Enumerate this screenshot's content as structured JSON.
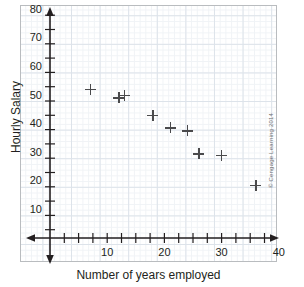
{
  "chart_data": {
    "type": "scatter",
    "title": "",
    "xlabel": "Number of years employed",
    "ylabel": "Hourly Salary",
    "xlim": [
      0,
      45
    ],
    "ylim": [
      0,
      85
    ],
    "grid": true,
    "legend": null,
    "x_ticks": [
      10,
      20,
      30,
      40
    ],
    "y_ticks": [
      10,
      20,
      30,
      40,
      50,
      60,
      70,
      80
    ],
    "x_minor_tick_step": 2.5,
    "y_minor_tick_step": 5,
    "marker": "plus",
    "marker_color": "#4a4a4c",
    "points": [
      {
        "x": 7,
        "y": 52
      },
      {
        "x": 12,
        "y": 49
      },
      {
        "x": 13,
        "y": 50
      },
      {
        "x": 18,
        "y": 43
      },
      {
        "x": 21,
        "y": 38.5
      },
      {
        "x": 24,
        "y": 37.5
      },
      {
        "x": 26,
        "y": 29.5
      },
      {
        "x": 30,
        "y": 29
      },
      {
        "x": 36,
        "y": 18.5
      }
    ]
  },
  "credit": "© Cengage Learning 2014",
  "colors": {
    "axis": "#231f20",
    "marker": "#4a4a4c",
    "grid_major": "#dde3ea",
    "grid_minor": "#f0f3f6",
    "frame": "#b9bcbf"
  }
}
